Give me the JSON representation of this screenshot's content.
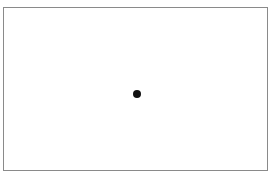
{
  "canvas": {
    "border_color": "#8a8a8a",
    "background": "#ffffff"
  },
  "marker": {
    "shape": "circle",
    "color": "#111111",
    "center": [
      137,
      94
    ],
    "diameter": 8
  }
}
